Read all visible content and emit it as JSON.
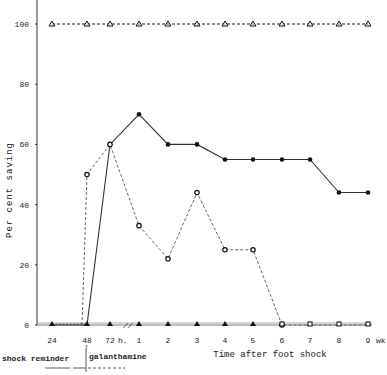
{
  "chart_data": {
    "type": "line",
    "title": "",
    "xlabel": "Time after foot shock",
    "ylabel": "Per cent saving",
    "ylim": [
      0,
      100
    ],
    "yticks": [
      0,
      20,
      40,
      60,
      80,
      100
    ],
    "categories": [
      "24",
      "48",
      "72 h.",
      "1",
      "2",
      "3",
      "4",
      "5",
      "6",
      "7",
      "8",
      "9 wk"
    ],
    "x_unit_hours": "h.",
    "x_unit_weeks": "wk",
    "axis_break_between": [
      "72 h.",
      "1"
    ],
    "grid": false,
    "series": [
      {
        "name": "open-triangle-dashed-control",
        "marker": "triangle-open",
        "line": "dashed",
        "values": [
          100,
          100,
          100,
          100,
          100,
          100,
          100,
          100,
          100,
          100,
          100,
          100
        ]
      },
      {
        "name": "filled-circle-solid",
        "marker": "circle-filled",
        "line": "solid",
        "values": [
          0,
          0,
          60,
          70,
          60,
          60,
          55,
          55,
          55,
          55,
          44,
          44
        ]
      },
      {
        "name": "open-circle-dashed",
        "marker": "circle-open",
        "line": "dashed",
        "values": [
          0,
          50,
          60,
          33,
          22,
          44,
          25,
          25,
          0,
          0,
          0,
          0
        ]
      },
      {
        "name": "filled-triangle-baseline",
        "marker": "triangle-filled",
        "line": "double",
        "values": [
          0,
          0,
          0,
          0,
          0,
          0,
          0,
          0,
          0,
          0,
          0,
          0
        ]
      }
    ],
    "annotations": [
      {
        "text": "shock reminder",
        "position": "below x-axis, left of 48"
      },
      {
        "text": "galanthamine",
        "position": "below x-axis, right of 48"
      }
    ]
  },
  "labels": {
    "ylabel_words": [
      "Per",
      "cent",
      "saving"
    ],
    "xlabel": "Time   after   foot   shock",
    "shock_reminder": "shock reminder",
    "galanthamine": "galanthamine",
    "break_mark": "//"
  }
}
